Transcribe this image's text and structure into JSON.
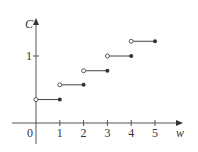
{
  "chart_data": {
    "type": "line",
    "subtype": "step-function",
    "title": "",
    "xlabel": "w",
    "ylabel": "C",
    "xlim": [
      -0.3,
      5.8
    ],
    "ylim": [
      -0.2,
      1.45
    ],
    "grid": false,
    "legend": null,
    "x_ticks": [
      "0",
      "1",
      "2",
      "3",
      "4",
      "5"
    ],
    "y_ticks": [
      "1"
    ],
    "segments": [
      {
        "x_start": 0,
        "x_end": 1,
        "y": 0.35,
        "start": "open",
        "end": "closed"
      },
      {
        "x_start": 1,
        "x_end": 2,
        "y": 0.57,
        "start": "open",
        "end": "closed"
      },
      {
        "x_start": 2,
        "x_end": 3,
        "y": 0.78,
        "start": "open",
        "end": "closed"
      },
      {
        "x_start": 3,
        "x_end": 4,
        "y": 1.0,
        "start": "open",
        "end": "closed"
      },
      {
        "x_start": 4,
        "x_end": 5,
        "y": 1.22,
        "start": "open",
        "end": "closed"
      }
    ]
  },
  "labels": {
    "x_axis": "w",
    "y_axis": "C",
    "origin": "0",
    "x_ticks": [
      "1",
      "2",
      "3",
      "4",
      "5"
    ],
    "y_tick": "1"
  },
  "colors": {
    "axis": "#555555",
    "line": "#444444",
    "dot": "#333333"
  }
}
